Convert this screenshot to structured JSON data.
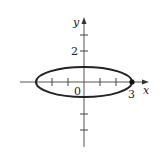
{
  "figure": {
    "type": "ellipse-plot",
    "axes": {
      "x_label": "x",
      "y_label": "y",
      "origin_label": "0",
      "x_tick_label": "3",
      "y_tick_label": "2"
    },
    "ellipse": {
      "center": [
        0,
        0
      ],
      "semi_axis_x": 3,
      "semi_axis_y": 1,
      "marked_point": [
        3,
        0
      ]
    },
    "colors": {
      "stroke": "#222222",
      "background": "#ffffff"
    }
  }
}
